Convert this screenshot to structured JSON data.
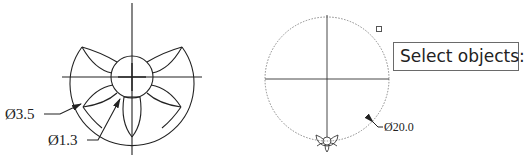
{
  "left_figure": {
    "label_outer": "Ø3.5",
    "label_inner": "Ø1.3"
  },
  "right_figure": {
    "label_circle": "Ø20.0"
  },
  "prompt": {
    "text": "Select objects:"
  },
  "colors": {
    "line": "#222222",
    "dotted": "#888888",
    "background": "#ffffff"
  }
}
